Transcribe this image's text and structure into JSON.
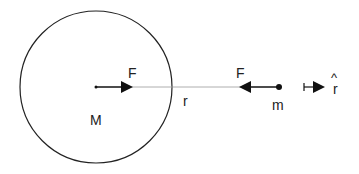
{
  "diagram": {
    "labels": {
      "large_mass": "M",
      "small_mass": "m",
      "force_on_M": "F",
      "force_on_m": "F",
      "separation": "r",
      "unit_vector": "r",
      "unit_vector_hat": "^"
    },
    "colors": {
      "stroke": "#222222",
      "line": "#999999",
      "background": "#ffffff"
    }
  }
}
